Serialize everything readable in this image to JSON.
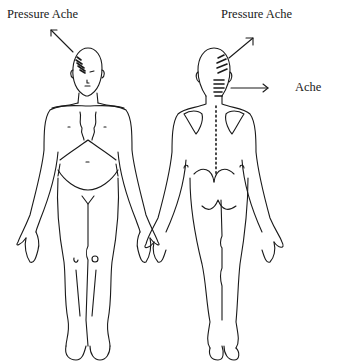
{
  "diagram": {
    "type": "body pain chart",
    "views": [
      {
        "name": "front",
        "annotations": [
          {
            "label": "Pressure Ache",
            "region": "right temple / forehead"
          }
        ]
      },
      {
        "name": "back",
        "annotations": [
          {
            "label": "Pressure Ache",
            "region": "back of head (occipital)"
          },
          {
            "label": "Ache",
            "region": "upper neck"
          }
        ]
      }
    ]
  },
  "labels": {
    "front_pressure_ache": "Pressure Ache",
    "back_pressure_ache": "Pressure Ache",
    "back_ache": "Ache"
  }
}
